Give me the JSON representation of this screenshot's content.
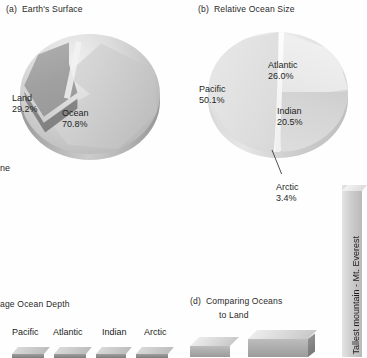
{
  "figure": {
    "background": "#fefefe",
    "ink": "#1c1c1c"
  },
  "panels": {
    "a": {
      "tag": "(a)",
      "title": "Earth's Surface",
      "slices": [
        {
          "label": "Land",
          "value": "29.2%"
        },
        {
          "label": "Ocean",
          "value": "70.8%"
        }
      ]
    },
    "b": {
      "tag": "(b)",
      "title": "Relative Ocean Size",
      "slices": [
        {
          "label": "Pacific",
          "value": "50.1%"
        },
        {
          "label": "Atlantic",
          "value": "26.0%"
        },
        {
          "label": "Indian",
          "value": "20.5%"
        },
        {
          "label": "Arctic",
          "value": "3.4%"
        }
      ]
    },
    "c": {
      "tag": "(c)",
      "title": "age Ocean Depth",
      "categories": [
        "Pacific",
        "Atlantic",
        "Indian",
        "Arctic"
      ]
    },
    "d": {
      "tag": "(d)",
      "title_line1": "Comparing Oceans",
      "title_line2": "to Land",
      "vertical_label": "Tallest mountain - Mt. Everest"
    }
  },
  "edge_fragments": {
    "left_mid": "ne"
  },
  "chart_data": [
    {
      "id": "a",
      "type": "pie",
      "title": "(a)  Earth's Surface",
      "categories": [
        "Land",
        "Ocean"
      ],
      "values": [
        29.2,
        70.8
      ],
      "unit": "%",
      "labels": [
        "Land 29.2%",
        "Ocean 70.8%"
      ],
      "style": "3D exploded pie, greyscale",
      "legend": "inline data labels"
    },
    {
      "id": "b",
      "type": "pie",
      "title": "(b)  Relative Ocean Size",
      "categories": [
        "Pacific",
        "Atlantic",
        "Indian",
        "Arctic"
      ],
      "values": [
        50.1,
        26.0,
        20.5,
        3.4
      ],
      "unit": "%",
      "labels": [
        "Pacific 50.1%",
        "Atlantic 26.0%",
        "Indian 20.5%",
        "Arctic 3.4%"
      ],
      "annotations": [
        "leader line from Arctic wedge to 'Arctic 3.4%' label"
      ],
      "style": "3D pie, greyscale",
      "legend": "inline data labels"
    },
    {
      "id": "c",
      "type": "bar",
      "title": "(c)  Average Ocean Depth",
      "categories": [
        "Pacific",
        "Atlantic",
        "Indian",
        "Arctic"
      ],
      "values": [
        null,
        null,
        null,
        null
      ],
      "xlabel": "",
      "ylabel": "",
      "note": "panel cropped at bottom of image; bar heights not visible",
      "style": "3D bars, greyscale"
    },
    {
      "id": "d",
      "type": "bar",
      "title": "(d)  Comparing Oceans to Land",
      "categories": [],
      "values": [],
      "annotations": [
        "Tallest mountain - Mt. Everest"
      ],
      "note": "panel cropped at bottom of image; only tops of 3D blocks visible",
      "style": "3D blocks, greyscale"
    }
  ]
}
